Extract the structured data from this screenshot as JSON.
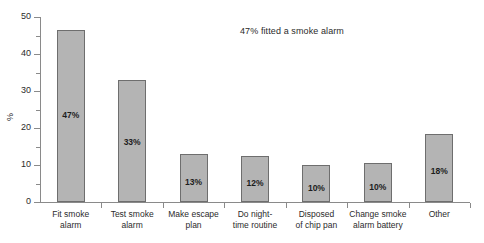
{
  "chart_data": {
    "type": "bar",
    "title": "",
    "annotation": "47% fitted a smoke alarm",
    "xlabel": "",
    "ylabel": "%",
    "ylim": [
      0,
      50
    ],
    "ytick_major": [
      0,
      10,
      20,
      30,
      40,
      50
    ],
    "ytick_minor": [
      5,
      15,
      25,
      35,
      45
    ],
    "grid": false,
    "legend": false,
    "bar_color": "#b4b4b4",
    "bar_edge_color": "#6e6e6e",
    "categories": [
      "Fit smoke alarm",
      "Test smoke alarm",
      "Make escape plan",
      "Do night-time routine",
      "Disposed of chip pan",
      "Change smoke alarm battery",
      "Other"
    ],
    "category_lines": [
      [
        "Fit smoke",
        "alarm"
      ],
      [
        "Test smoke",
        "alarm"
      ],
      [
        "Make escape",
        "plan"
      ],
      [
        "Do night-",
        "time routine"
      ],
      [
        "Disposed",
        "of chip pan"
      ],
      [
        "Change smoke",
        "alarm battery"
      ],
      [
        "Other"
      ]
    ],
    "values": [
      46.5,
      33,
      13,
      12.5,
      10,
      10.5,
      18.5
    ],
    "data_labels": [
      "47%",
      "33%",
      "13%",
      "12%",
      "10%",
      "10%",
      "18%"
    ]
  }
}
